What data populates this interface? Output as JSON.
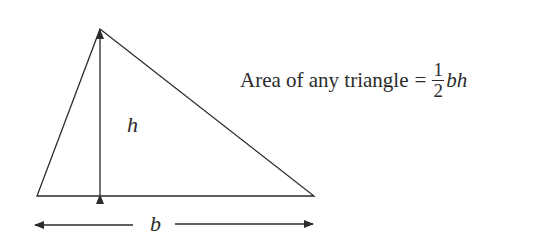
{
  "diagram": {
    "type": "triangle-area",
    "stroke_color": "#2b2b2b",
    "vertices": {
      "apex": [
        100,
        29
      ],
      "bottom_left": [
        37,
        196
      ],
      "bottom_right": [
        314,
        196
      ]
    },
    "height_arrow": {
      "x": 100,
      "y1": 29,
      "y2": 196
    },
    "base_arrows": {
      "y": 225,
      "left": [
        35,
        133
      ],
      "right": [
        175,
        313
      ]
    },
    "labels": {
      "height": "h",
      "base": "b"
    }
  },
  "formula": {
    "prefix": "Area of any triangle",
    "equals": "=",
    "numerator": "1",
    "denominator": "2",
    "variables": "bh"
  }
}
